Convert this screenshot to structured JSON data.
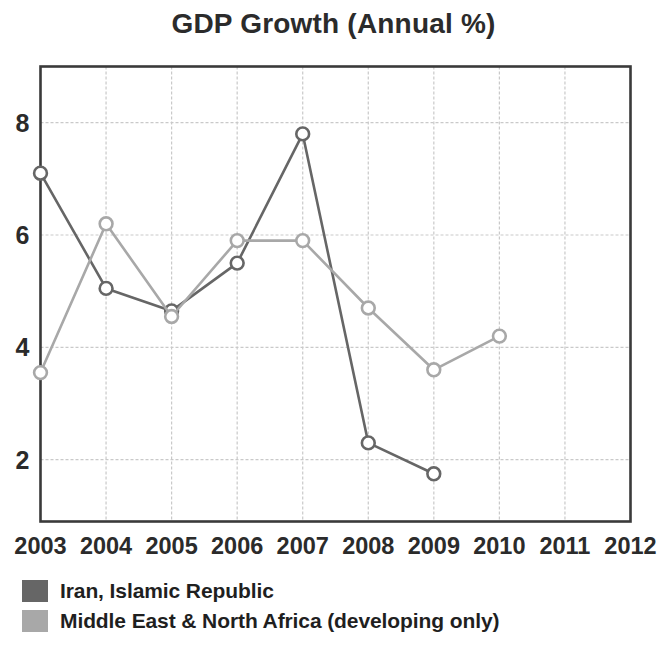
{
  "chart_data": {
    "type": "line",
    "title": "GDP Growth (Annual %)",
    "xlabel": "",
    "ylabel": "",
    "x": [
      2003,
      2004,
      2005,
      2006,
      2007,
      2008,
      2009,
      2010,
      2011,
      2012
    ],
    "categories": [
      "2003",
      "2004",
      "2005",
      "2006",
      "2007",
      "2008",
      "2009",
      "2010",
      "2011",
      "2012"
    ],
    "xlim": [
      2003,
      2012
    ],
    "ylim": [
      0.9,
      9.0
    ],
    "yticks": [
      2,
      4,
      6,
      8
    ],
    "ytick_labels": [
      "2",
      "4",
      "6",
      "8"
    ],
    "grid": true,
    "legend_position": "below",
    "series": [
      {
        "name": "Iran, Islamic Republic",
        "color": "#666666",
        "marker": "circle",
        "values": [
          7.1,
          5.05,
          4.65,
          5.5,
          7.8,
          2.3,
          1.75,
          null,
          null,
          null
        ]
      },
      {
        "name": "Middle East & North Africa (developing only)",
        "color": "#a8a8a8",
        "marker": "circle",
        "values": [
          3.55,
          6.2,
          4.55,
          5.9,
          5.9,
          4.7,
          3.6,
          4.2,
          null,
          null
        ]
      }
    ]
  },
  "legend": {
    "items": [
      {
        "label": "Iran, Islamic Republic",
        "color": "#666666"
      },
      {
        "label": "Middle East & North Africa (developing only)",
        "color": "#a8a8a8"
      }
    ]
  }
}
